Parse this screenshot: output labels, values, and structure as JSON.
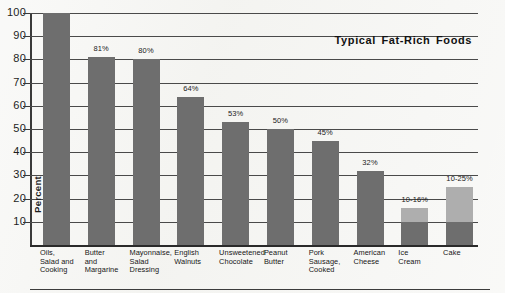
{
  "chart_data": {
    "type": "bar",
    "title": "Typical Fat-Rich Foods",
    "xlabel": "",
    "ylabel": "Percent",
    "ylim": [
      0,
      100
    ],
    "grid": true,
    "legend": "none",
    "ytick_labels": [
      "100",
      "90",
      "80",
      "70",
      "60",
      "50",
      "40",
      "30",
      "20",
      "10"
    ],
    "ytick_values": [
      100,
      90,
      80,
      70,
      60,
      50,
      40,
      30,
      20,
      10
    ],
    "categories": [
      "Oils,\nSalad and\nCooking",
      "Butter\nand\nMargarine",
      "Mayonnaise,\nSalad\nDressing",
      "English\nWalnuts",
      "Unsweetened\nChocolate",
      "Peanut\nButter",
      "Pork\nSausage,\nCooked",
      "American\nCheese",
      "Ice\nCream",
      "Cake"
    ],
    "values": [
      100,
      81,
      80,
      64,
      53,
      50,
      45,
      32,
      16,
      25
    ],
    "value_labels": [
      "",
      "81%",
      "80%",
      "64%",
      "53%",
      "50%",
      "45%",
      "32%",
      "10-16%",
      "10-25%"
    ],
    "range_lows": [
      null,
      null,
      null,
      null,
      null,
      null,
      null,
      null,
      10,
      10
    ],
    "range_highs": [
      null,
      null,
      null,
      null,
      null,
      null,
      null,
      null,
      16,
      25
    ],
    "bar_color": "#6e6e6e",
    "bar_range_color": "#aeaeae"
  },
  "categories_display": [
    {
      "line1": "Oils,",
      "line2": "Salad and",
      "line3": "Cooking"
    },
    {
      "line1": "Butter",
      "line2": "and",
      "line3": "Margarine"
    },
    {
      "line1": "Mayonnaise,",
      "line2": "Salad",
      "line3": "Dressing"
    },
    {
      "line1": "English",
      "line2": "Walnuts",
      "line3": ""
    },
    {
      "line1": "Unsweetened",
      "line2": "Chocolate",
      "line3": ""
    },
    {
      "line1": "Peanut",
      "line2": "Butter",
      "line3": ""
    },
    {
      "line1": "Pork",
      "line2": "Sausage,",
      "line3": "Cooked"
    },
    {
      "line1": "American",
      "line2": "Cheese",
      "line3": ""
    },
    {
      "line1": "Ice",
      "line2": "Cream",
      "line3": ""
    },
    {
      "line1": "Cake",
      "line2": "",
      "line3": ""
    }
  ]
}
